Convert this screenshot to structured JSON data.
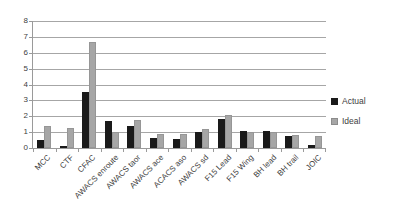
{
  "chart_data": {
    "type": "bar",
    "title": "",
    "xlabel": "",
    "ylabel": "",
    "categories": [
      "MCC",
      "CTF",
      "CFAC",
      "AWACS enroute",
      "AWACS taor",
      "AWACS ace",
      "ACACS aso",
      "AWACS sd",
      "F15 Lead",
      "F15 Wing",
      "BH lead",
      "BH trail",
      "JOIC"
    ],
    "series": [
      {
        "name": "Actual",
        "color": "#1a1a1a",
        "values": [
          0.5,
          0.15,
          3.5,
          1.7,
          1.4,
          0.65,
          0.55,
          1.0,
          1.85,
          1.05,
          1.1,
          0.75,
          0.2
        ]
      },
      {
        "name": "Ideal",
        "color": "#a6a6a6",
        "values": [
          1.4,
          1.25,
          6.7,
          1.0,
          1.75,
          0.9,
          0.9,
          1.2,
          2.1,
          1.0,
          1.0,
          0.85,
          0.75
        ]
      }
    ],
    "ylim": [
      0,
      8
    ],
    "yticks": [
      0,
      1,
      2,
      3,
      4,
      5,
      6,
      7,
      8
    ],
    "grid": true,
    "legend_position": "right"
  },
  "colors": {
    "background": "#ffffff",
    "actual_bar": "#1a1a1a",
    "ideal_bar": "#a6a6a6",
    "gridline": "#a6a6a6",
    "axis": "#9a9a9a",
    "text": "#404040"
  }
}
